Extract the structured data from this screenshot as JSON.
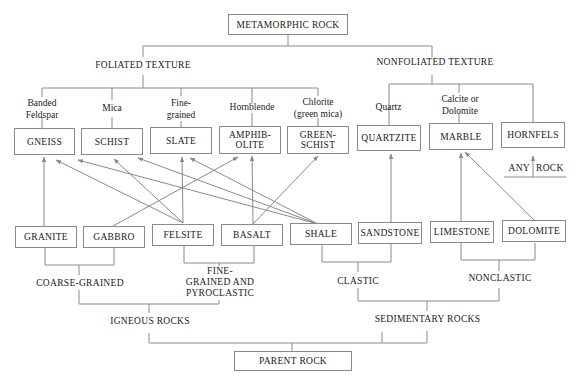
{
  "diagram": {
    "root": "METAMORPHIC ROCK",
    "parent": "PARENT ROCK",
    "textures": {
      "foliated": "FOLIATED TEXTURE",
      "nonfoliated": "NONFOLIATED TEXTURE"
    },
    "minerals": [
      {
        "line1": "Banded",
        "line2": "Feldspar"
      },
      {
        "line1": "Mica",
        "line2": ""
      },
      {
        "line1": "Fine-",
        "line2": "grained"
      },
      {
        "line1": "Hornblende",
        "line2": ""
      },
      {
        "line1": "Chlorite",
        "line2": "(green mica)"
      },
      {
        "line1": "Quartz",
        "line2": ""
      },
      {
        "line1": "Calcite or",
        "line2": "Dolomite"
      }
    ],
    "metamorphic_rocks": [
      {
        "line1": "GNEISS",
        "line2": ""
      },
      {
        "line1": "SCHIST",
        "line2": ""
      },
      {
        "line1": "SLATE",
        "line2": ""
      },
      {
        "line1": "AMPHIB-",
        "line2": "OLITE"
      },
      {
        "line1": "GREEN-",
        "line2": "SCHIST"
      },
      {
        "line1": "QUARTZITE",
        "line2": ""
      },
      {
        "line1": "MARBLE",
        "line2": ""
      },
      {
        "line1": "HORNFELS",
        "line2": ""
      }
    ],
    "any_rock": {
      "left": "ANY",
      "right": "ROCK"
    },
    "parent_rocks": [
      "GRANITE",
      "GABBRO",
      "FELSITE",
      "BASALT",
      "SHALE",
      "SANDSTONE",
      "LIMESTONE",
      "DOLOMITE"
    ],
    "groups": {
      "coarse": "COARSE-GRAINED",
      "fine": {
        "line1": "FINE-",
        "line2": "GRAINED AND",
        "line3": "PYROCLASTIC"
      },
      "clastic": "CLASTIC",
      "nonclastic": "NONCLASTIC",
      "igneous": "IGNEOUS ROCKS",
      "sedimentary": "SEDIMENTARY ROCKS"
    },
    "arrows": [
      {
        "from": "GRANITE",
        "to": "GNEISS"
      },
      {
        "from": "FELSITE",
        "to": "GNEISS"
      },
      {
        "from": "SHALE",
        "to": "GNEISS"
      },
      {
        "from": "FELSITE",
        "to": "SCHIST"
      },
      {
        "from": "SHALE",
        "to": "SCHIST"
      },
      {
        "from": "FELSITE",
        "to": "SLATE"
      },
      {
        "from": "SHALE",
        "to": "SLATE"
      },
      {
        "from": "GABBRO",
        "to": "AMPHIBOLITE"
      },
      {
        "from": "BASALT",
        "to": "AMPHIBOLITE"
      },
      {
        "from": "BASALT",
        "to": "GREENSCHIST"
      },
      {
        "from": "SANDSTONE",
        "to": "QUARTZITE"
      },
      {
        "from": "LIMESTONE",
        "to": "MARBLE"
      },
      {
        "from": "DOLOMITE",
        "to": "MARBLE"
      },
      {
        "from": "ANY ROCK",
        "to": "HORNFELS"
      }
    ]
  }
}
